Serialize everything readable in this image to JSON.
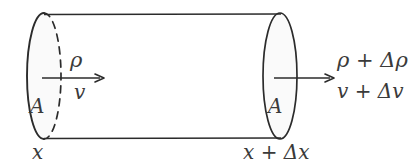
{
  "figure": {
    "type": "physics-diagram",
    "canvas": {
      "width": 410,
      "height": 166
    },
    "colors": {
      "background": "#ffffff",
      "stroke": "#2b2b2b",
      "face_fill": "#fafafa",
      "text": "#3a3a3a"
    },
    "shapes": {
      "cylinder": {
        "top_edge_y": 15,
        "bottom_edge_y": 138,
        "left_x": 44,
        "right_x": 283,
        "left_face": {
          "center_x": 44,
          "center_y": 76,
          "rx": 17,
          "ry": 63,
          "near_arc": "solid",
          "far_arc": "dashed"
        },
        "right_face": {
          "center_x": 280,
          "center_y": 76,
          "rx": 17,
          "ry": 63,
          "outline": "solid"
        }
      },
      "arrows": [
        {
          "name": "inflow-velocity-arrow",
          "x1": 42,
          "y1": 78,
          "x2": 104,
          "y2": 78
        },
        {
          "name": "outflow-velocity-arrow",
          "x1": 274,
          "y1": 78,
          "x2": 334,
          "y2": 78
        }
      ]
    },
    "labels": {
      "area_left": "A",
      "area_right": "A",
      "density_in": "ρ",
      "velocity_in": "v",
      "density_out": "ρ + Δρ",
      "velocity_out": "v + Δv",
      "position_left": "x",
      "position_right": "x + Δx"
    }
  }
}
